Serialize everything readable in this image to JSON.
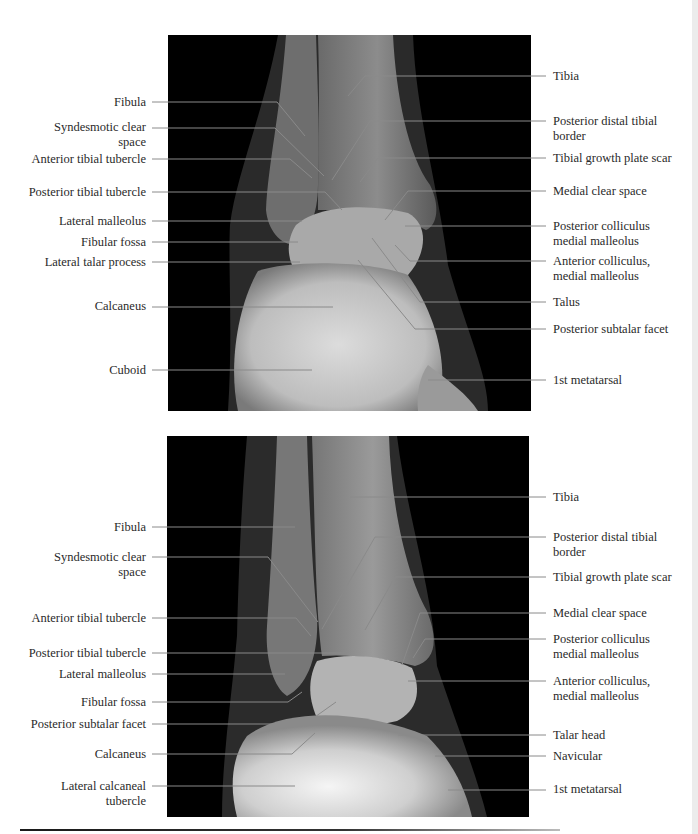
{
  "figure": {
    "panels": [
      {
        "id": "top",
        "view": "ankle radiograph (upper panel)",
        "left_labels": [
          {
            "text": "Fibula",
            "y": 102
          },
          {
            "text": "Syndesmotic clear\nspace",
            "y": 127
          },
          {
            "text": "Anterior tibial tubercle",
            "y": 159
          },
          {
            "text": "Posterior tibial tubercle",
            "y": 192
          },
          {
            "text": "Lateral malleolus",
            "y": 221
          },
          {
            "text": "Fibular fossa",
            "y": 242
          },
          {
            "text": "Lateral talar process",
            "y": 262
          },
          {
            "text": "Calcaneus",
            "y": 306
          },
          {
            "text": "Cuboid",
            "y": 370
          }
        ],
        "right_labels": [
          {
            "text": "Tibia",
            "y": 76
          },
          {
            "text": "Posterior distal tibial\nborder",
            "y": 121
          },
          {
            "text": "Tibial growth plate scar",
            "y": 158
          },
          {
            "text": "Medial clear space",
            "y": 191
          },
          {
            "text": "Posterior colliculus\nmedial malleolus",
            "y": 226
          },
          {
            "text": "Anterior colliculus,\nmedial malleolus",
            "y": 261
          },
          {
            "text": "Talus",
            "y": 302
          },
          {
            "text": "Posterior subtalar facet",
            "y": 330
          },
          {
            "text": "1st metatarsal",
            "y": 380
          }
        ]
      },
      {
        "id": "bottom",
        "view": "ankle radiograph (lower panel)",
        "left_labels": [
          {
            "text": "Fibula",
            "y": 527
          },
          {
            "text": "Syndesmotic clear\nspace",
            "y": 557
          },
          {
            "text": "Anterior tibial tubercle",
            "y": 618
          },
          {
            "text": "Posterior tibial tubercle",
            "y": 653
          },
          {
            "text": "Lateral malleolus",
            "y": 674
          },
          {
            "text": "Fibular fossa",
            "y": 702
          },
          {
            "text": "Posterior subtalar facet",
            "y": 724
          },
          {
            "text": "Calcaneus",
            "y": 754
          },
          {
            "text": "Lateral calcaneal\ntubercle",
            "y": 786
          }
        ],
        "right_labels": [
          {
            "text": "Tibia",
            "y": 497
          },
          {
            "text": "Posterior distal tibial\nborder",
            "y": 537
          },
          {
            "text": "Tibial growth plate scar",
            "y": 577
          },
          {
            "text": "Medial clear space",
            "y": 613
          },
          {
            "text": "Posterior colliculus\nmedial malleolus",
            "y": 639
          },
          {
            "text": "Anterior colliculus,\nmedial malleolus",
            "y": 681
          },
          {
            "text": "Talar head",
            "y": 735
          },
          {
            "text": "Navicular",
            "y": 756
          },
          {
            "text": "1st metatarsal",
            "y": 789
          }
        ]
      }
    ]
  }
}
